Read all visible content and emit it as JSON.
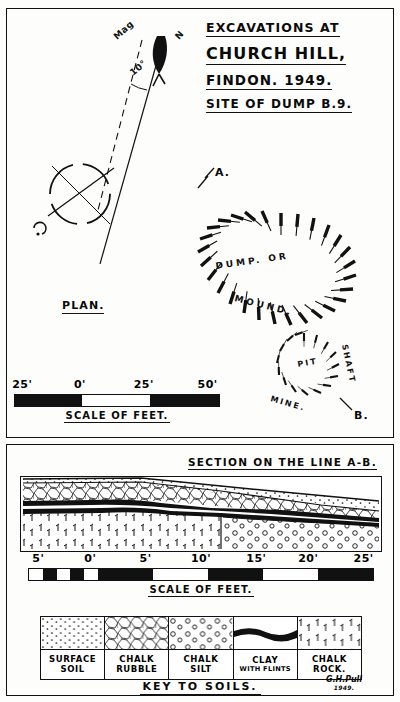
{
  "title_block": {
    "line1": "EXCAVATIONS AT",
    "line2": "CHURCH HILL,",
    "line3": "FINDON. 1949.",
    "line4": "SITE OF DUMP B.9."
  },
  "compass": {
    "magnetic_label": "Mag",
    "declination": "10°",
    "north_label": "N"
  },
  "plan": {
    "caption": "PLAN.",
    "section_line_start": "A.",
    "section_line_end": "B.",
    "mound_label_1": "DUMP. OR",
    "mound_label_2": "MOUND.",
    "shaft_label_pit": "PIT",
    "shaft_label_shaft": "SHAFT",
    "shaft_label_mine": "MINE.",
    "scale": {
      "caption": "SCALE OF FEET.",
      "ticks": [
        "25'",
        "0'",
        "25'",
        "50'"
      ]
    }
  },
  "section": {
    "title": "SECTION ON THE LINE A-B.",
    "scale": {
      "caption": "SCALE OF FEET.",
      "ticks": [
        "5'",
        "0'",
        "5'",
        "10'",
        "15'",
        "20'",
        "25'"
      ]
    }
  },
  "key": {
    "caption": "KEY TO SOILS.",
    "items": [
      {
        "line1": "SURFACE",
        "line2": "SOIL",
        "pattern": "surface-soil",
        "small": false
      },
      {
        "line1": "CHALK",
        "line2": "RUBBLE",
        "pattern": "chalk-rubble",
        "small": false
      },
      {
        "line1": "CHALK",
        "line2": "SILT",
        "pattern": "chalk-silt",
        "small": false
      },
      {
        "line1": "CLAY",
        "line2": "WITH FLINTS",
        "pattern": "clay-with-flints",
        "small": true
      },
      {
        "line1": "CHALK",
        "line2": "ROCK.",
        "pattern": "chalk-rock",
        "small": false
      }
    ]
  },
  "signature": {
    "name": "G.H.Pull",
    "year": "1949."
  },
  "colors": {
    "ink": "#111111",
    "paper": "#fdfdfb"
  }
}
